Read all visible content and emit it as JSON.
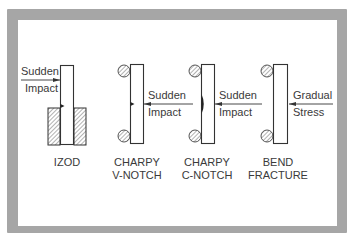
{
  "colors": {
    "frame": "#a6a6a6",
    "background": "#ffffff",
    "stroke": "#333333",
    "text": "#3a3a3a"
  },
  "specimens": [
    {
      "id": "izod",
      "caption_line1": "IZOD",
      "caption_line2": "",
      "force_line1": "Sudden",
      "force_line2": "Impact",
      "force_direction": "left-to-right",
      "support": "clamped-vise",
      "notch": "v-notch"
    },
    {
      "id": "charpy-v",
      "caption_line1": "CHARPY",
      "caption_line2": "V-NOTCH",
      "force_line1": "Sudden",
      "force_line2": "Impact",
      "force_direction": "right-to-left",
      "support": "two-round-anvils",
      "notch": "v-notch"
    },
    {
      "id": "charpy-c",
      "caption_line1": "CHARPY",
      "caption_line2": "C-NOTCH",
      "force_line1": "Sudden",
      "force_line2": "Impact",
      "force_direction": "right-to-left",
      "support": "two-round-anvils",
      "notch": "c-notch"
    },
    {
      "id": "bend",
      "caption_line1": "BEND",
      "caption_line2": "FRACTURE",
      "force_line1": "Gradual",
      "force_line2": "Stress",
      "force_direction": "right-to-left",
      "support": "two-round-anvils",
      "notch": "none"
    }
  ]
}
